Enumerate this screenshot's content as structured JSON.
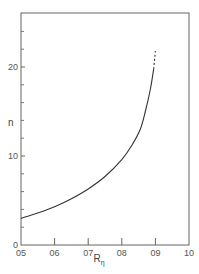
{
  "chart_data": {
    "type": "line",
    "title": "",
    "xlabel": "R",
    "xlabel_subscript": "η",
    "ylabel": "n",
    "xlim": [
      0.5,
      1.0
    ],
    "ylim": [
      0,
      27
    ],
    "grid": false,
    "x_ticks": [
      0.5,
      0.6,
      0.7,
      0.8,
      0.9,
      1.0
    ],
    "x_tick_labels": [
      "05",
      "06",
      "07",
      "08",
      "09",
      "10"
    ],
    "y_major_ticks": [
      0,
      10,
      20
    ],
    "y_tick_labels": [
      "0",
      "10",
      "20"
    ],
    "y_minor_ticks": [
      2,
      4,
      6,
      8,
      12,
      14,
      16,
      18,
      22,
      24
    ],
    "series": [
      {
        "name": "n vs R",
        "style": "solid",
        "x": [
          0.5,
          0.55,
          0.6,
          0.65,
          0.7,
          0.75,
          0.8,
          0.83,
          0.855,
          0.87,
          0.885,
          0.895
        ],
        "y": [
          3.0,
          3.6,
          4.3,
          5.2,
          6.3,
          7.7,
          9.6,
          11.2,
          13.0,
          15.0,
          17.5,
          19.8
        ]
      },
      {
        "name": "extrapolation",
        "style": "dashed",
        "x": [
          0.895,
          0.9
        ],
        "y": [
          19.8,
          21.8
        ]
      }
    ]
  }
}
